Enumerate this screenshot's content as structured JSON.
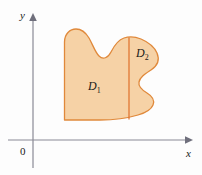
{
  "figure": {
    "kind": "math-diagram",
    "background_color": "#fdfdfd"
  },
  "axes": {
    "x_label": "x",
    "y_label": "y",
    "origin_label": "0",
    "axis_color": "#8a8a96",
    "x_axis_y": 140,
    "y_axis_x": 33,
    "x_axis_start": 8,
    "x_axis_end": 192,
    "y_axis_top": 14,
    "y_axis_bottom": 168
  },
  "region": {
    "fill_color": "#f6d2a6",
    "stroke_color": "#e0893b",
    "divider_color": "#e0702a",
    "outline_path": "M 64.5 42 C 64.5 34 70 29 76 29 C 82 29 86 33 89 38 C 93 45 95 52 99 56 C 103 60 108 58 111 52 C 114 46 118 40 124 38 C 130 36 136 37 141 39 C 148 42 154 46 157 53 C 160 60 157 66 151 70 C 145 74 140 77 139 82 C 138 87 142 90 147 93 C 152 96 155 100 153 105 C 151 110 145 113 138 115 C 128 118 115 120 100 120 C 88 120 76 120 66 120 L 64.5 120 Z",
    "divider_line": {
      "x": 129,
      "y_top": 37.5,
      "y_bottom": 119.5
    },
    "subregions": [
      {
        "id": "D1",
        "label": "D",
        "subscript": "1",
        "label_x": 88,
        "label_y": 90
      },
      {
        "id": "D2",
        "label": "D",
        "subscript": "2",
        "label_x": 136,
        "label_y": 57
      }
    ]
  }
}
